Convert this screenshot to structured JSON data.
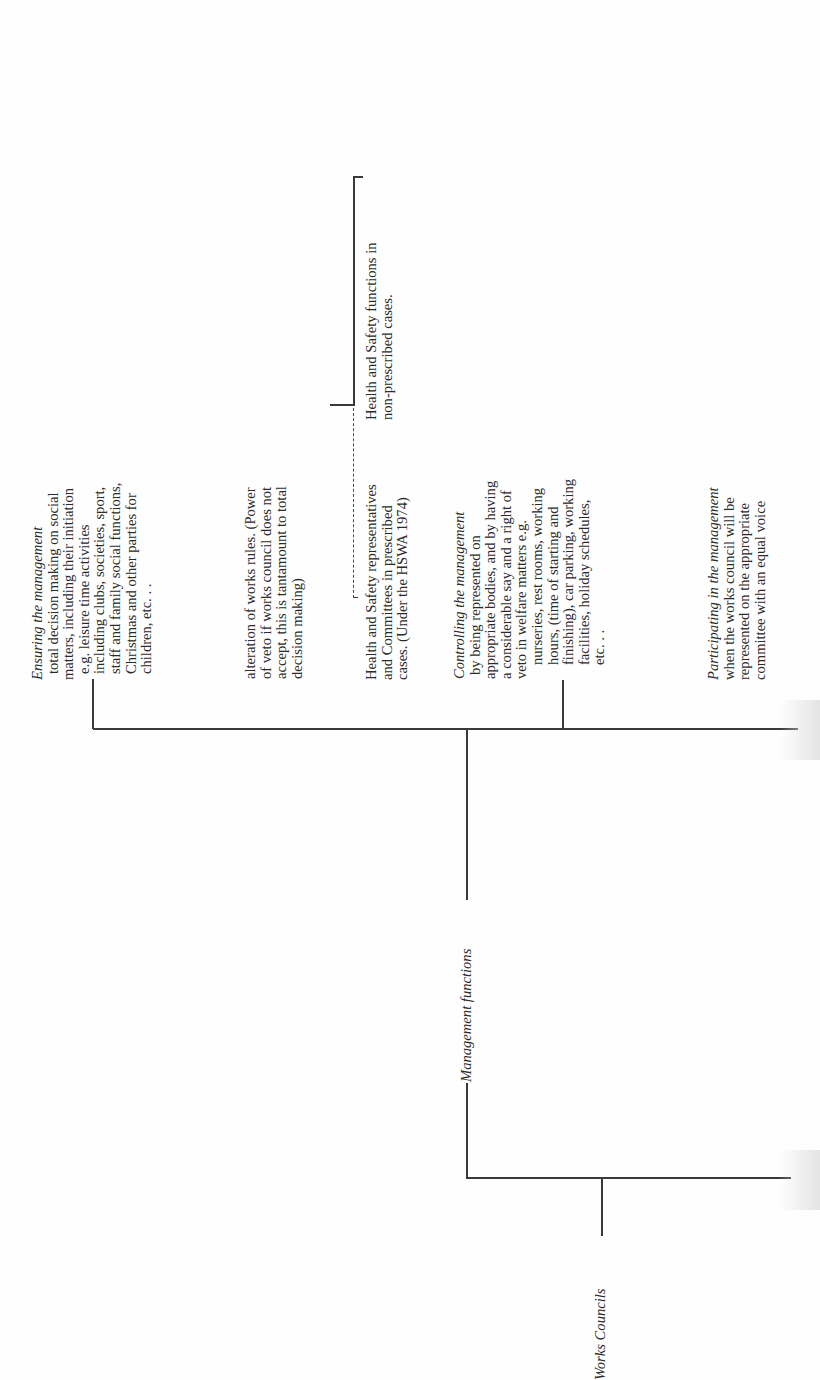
{
  "diagram": {
    "orientation": "rotated-90-ccw",
    "root": {
      "label": "Works Councils",
      "children": [
        {
          "label": "Management functions",
          "children": [
            {
              "heading": "Ensuring the management",
              "lines": [
                "total decision making on social",
                "matters, including their initiation",
                "e.g. leisure time activities",
                "including clubs, societies, sport,",
                "staff and family social functions,",
                "Christmas and other parties for",
                "children, etc. . ."
              ]
            },
            {
              "heading": "",
              "lines": [
                "alteration of works rules. (Power",
                "of veto if works council does not",
                "accept, this is tantamount to total",
                "decision making)"
              ]
            },
            {
              "heading": "",
              "lines": [
                "Health and Safety representatives",
                "and Committees in prescribed",
                "cases. (Under the HSWA 1974)"
              ]
            },
            {
              "heading": "Controlling the management",
              "lines": [
                "by being represented on",
                "appropriate bodies, and by having",
                "a considerable say and a right of",
                "veto in welfare matters e.g.",
                "nurseries, rest rooms, working",
                "hours, (time of starting and",
                "finishing), car parking, working",
                "facilities, holiday schedules,",
                "etc. . ."
              ]
            },
            {
              "heading": "Participating in the management",
              "lines": [
                "when the works council will be",
                "represented on the appropriate",
                "committee with an equal voice"
              ]
            }
          ]
        }
      ]
    },
    "side_note": {
      "lines": [
        "Health and Safety functions in",
        "non-prescribed cases."
      ]
    }
  }
}
